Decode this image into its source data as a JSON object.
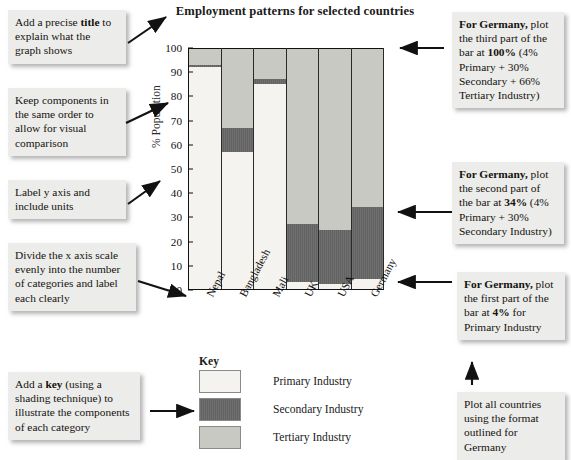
{
  "chart_data": {
    "type": "bar",
    "subtype": "stacked-bar-100-percent",
    "title": "Employment patterns for selected countries",
    "xlabel": "",
    "ylabel": "% Population",
    "ylim": [
      0,
      100
    ],
    "yticks": [
      0,
      10,
      20,
      30,
      40,
      50,
      60,
      70,
      80,
      90,
      100
    ],
    "grid": false,
    "legend_position": "bottom-center",
    "legend_title": "Key",
    "categories": [
      "Nepal",
      "Bangladesh",
      "Mali",
      "UK",
      "USA",
      "Germany"
    ],
    "series": [
      {
        "name": "Primary Industry",
        "values": [
          92,
          57,
          85,
          3,
          2,
          4
        ]
      },
      {
        "name": "Secondary Industry",
        "values": [
          1,
          10,
          2,
          24,
          22.5,
          30
        ]
      },
      {
        "name": "Tertiary Industry",
        "values": [
          7,
          33,
          13,
          73,
          75.5,
          66
        ]
      }
    ],
    "cumulative": [
      {
        "name": "Primary Industry",
        "values": [
          92,
          57,
          85,
          3,
          2,
          4
        ]
      },
      {
        "name": "Secondary Industry",
        "values": [
          93,
          67,
          87,
          27,
          24.5,
          34
        ]
      },
      {
        "name": "Tertiary Industry",
        "values": [
          100,
          100,
          100,
          100,
          100,
          100
        ]
      }
    ],
    "colors": {
      "primary": "#f4f3ef",
      "secondary": "#676767",
      "tertiary": "#c9c9c4"
    }
  },
  "legend": {
    "title": "Key",
    "items": [
      {
        "label": "Primary Industry",
        "swatch": "primary"
      },
      {
        "label": "Secondary Industry",
        "swatch": "secondary"
      },
      {
        "label": "Tertiary Industry",
        "swatch": "tertiary"
      }
    ]
  },
  "notes_left": [
    {
      "id": "title-note",
      "html": "Add a precise <b>title</b> to explain what the graph shows"
    },
    {
      "id": "order-note",
      "html": "Keep components in the same order to allow for visual comparison"
    },
    {
      "id": "yaxis-note",
      "html": "Label y axis and include units"
    },
    {
      "id": "xaxis-note",
      "html": "Divide the x axis scale evenly into the number of categories and label each clearly"
    },
    {
      "id": "key-note",
      "html": "Add a <b>key</b> (using a shading technique) to illustrate the components of each category"
    }
  ],
  "notes_right": [
    {
      "id": "germany-third",
      "html": "<b>For Germany,</b> plot the third part of the bar at <b>100%</b> (4% Primary + 30% Secondary + 66% Tertiary Industry)"
    },
    {
      "id": "germany-second",
      "html": "<b>For Germany,</b> plot the second part of the bar at <b>34%</b> (4% Primary + 30% Secondary Industry)"
    },
    {
      "id": "germany-first",
      "html": "<b>For Germany,</b> plot the first part of the bar at <b>4%</b> for Primary Industry"
    },
    {
      "id": "all-countries",
      "html": "Plot all countries using the format outlined for Germany"
    }
  ]
}
